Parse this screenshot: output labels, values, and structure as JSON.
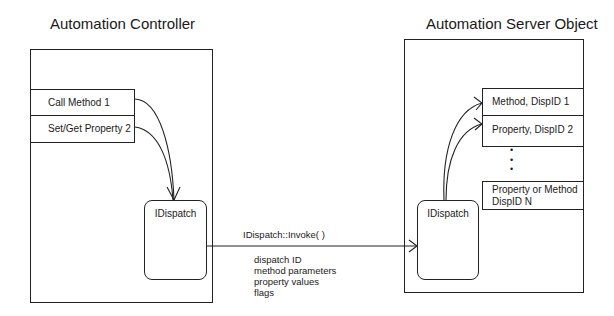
{
  "controller": {
    "title": "Automation Controller",
    "items": [
      {
        "label": "Call Method 1"
      },
      {
        "label": "Set/Get Property 2"
      }
    ],
    "dispatch_label": "IDispatch"
  },
  "server": {
    "title": "Automation Server Object",
    "items": [
      {
        "label": "Method, DispID 1"
      },
      {
        "label": "Property, DispID 2"
      },
      {
        "label": "Property or Method\nDispID N"
      }
    ],
    "ellipsis": "•\n•\n•",
    "dispatch_label": "IDispatch"
  },
  "call": {
    "label": "IDispatch::Invoke( )",
    "params": [
      "dispatch ID",
      "method parameters",
      "property values",
      "flags"
    ]
  }
}
